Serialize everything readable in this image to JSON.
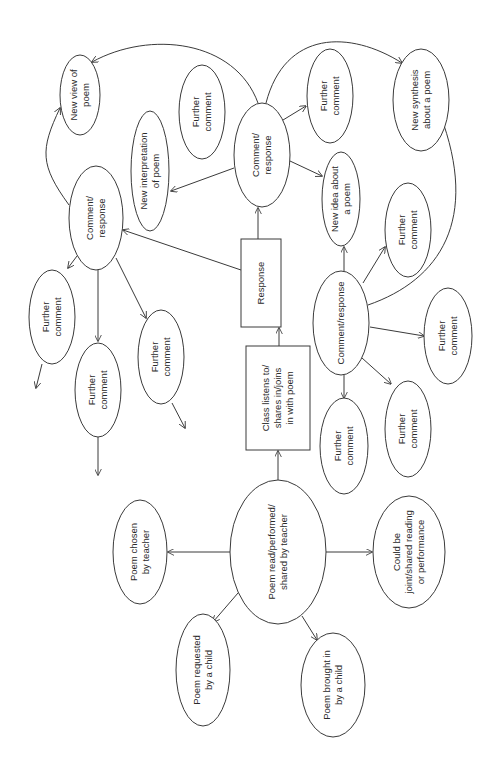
{
  "diagram": {
    "type": "concept-map",
    "orientation": "rotated 90deg counter-clockwise",
    "stroke_color": "#3a3a3a",
    "background": "#ffffff",
    "nodes": {
      "poem_read": {
        "lines": [
          "Poem read/performed/",
          "shared by teacher"
        ],
        "shape": "ellipse"
      },
      "poem_chosen": {
        "lines": [
          "Poem chosen",
          "by teacher"
        ],
        "shape": "ellipse"
      },
      "poem_requested": {
        "lines": [
          "Poem requested",
          "by a child"
        ],
        "shape": "ellipse"
      },
      "poem_brought": {
        "lines": [
          "Poem brought in",
          "by a child"
        ],
        "shape": "ellipse"
      },
      "could_be_joint": {
        "lines": [
          "Could be",
          "joint/shared reading",
          "or performance"
        ],
        "shape": "ellipse"
      },
      "class_listens": {
        "lines": [
          "Class listens to/",
          "shares in/joins",
          "in with poem"
        ],
        "shape": "rectangle"
      },
      "response": {
        "lines": [
          "Response"
        ],
        "shape": "rectangle"
      },
      "comment_top": {
        "lines": [
          "Comment/",
          "response"
        ],
        "shape": "ellipse"
      },
      "comment_left": {
        "lines": [
          "Comment/",
          "response"
        ],
        "shape": "ellipse"
      },
      "comment_right": {
        "lines": [
          "Comment/response"
        ],
        "shape": "ellipse"
      },
      "new_view": {
        "lines": [
          "New view of",
          "poem"
        ],
        "shape": "ellipse"
      },
      "new_interpretation": {
        "lines": [
          "New interpretation",
          "of poem"
        ],
        "shape": "ellipse"
      },
      "new_idea": {
        "lines": [
          "New idea about",
          "a poem"
        ],
        "shape": "ellipse"
      },
      "new_synthesis": {
        "lines": [
          "New synthesis",
          "about a poem"
        ],
        "shape": "ellipse"
      },
      "further_top": {
        "lines": [
          "Further",
          "comment"
        ],
        "shape": "ellipse"
      },
      "further_left_1": {
        "lines": [
          "Further",
          "comment"
        ],
        "shape": "ellipse"
      },
      "further_left_2": {
        "lines": [
          "Further",
          "comment"
        ],
        "shape": "ellipse"
      },
      "further_left_3": {
        "lines": [
          "Further",
          "comment"
        ],
        "shape": "ellipse"
      },
      "further_right_1": {
        "lines": [
          "Further",
          "comment"
        ],
        "shape": "ellipse"
      },
      "further_right_2": {
        "lines": [
          "Further",
          "comment"
        ],
        "shape": "ellipse"
      },
      "further_right_3": {
        "lines": [
          "Further",
          "comment"
        ],
        "shape": "ellipse"
      },
      "further_right_4": {
        "lines": [
          "Further",
          "comment"
        ],
        "shape": "ellipse"
      }
    },
    "edges": [
      {
        "from": "poem_read",
        "to": "poem_chosen"
      },
      {
        "from": "poem_read",
        "to": "poem_requested"
      },
      {
        "from": "poem_read",
        "to": "poem_brought"
      },
      {
        "from": "poem_read",
        "to": "could_be_joint"
      },
      {
        "from": "poem_read",
        "to": "class_listens"
      },
      {
        "from": "class_listens",
        "to": "response"
      },
      {
        "from": "response",
        "to": "comment_top"
      },
      {
        "from": "response",
        "to": "comment_left"
      },
      {
        "from": "comment_top",
        "to": "new_interpretation"
      },
      {
        "from": "comment_top",
        "to": "further_top"
      },
      {
        "from": "comment_top",
        "to": "new_idea"
      },
      {
        "from": "comment_top",
        "to": "new_view"
      },
      {
        "from": "comment_top",
        "to": "new_synthesis"
      },
      {
        "from": "comment_left",
        "to": "new_view"
      },
      {
        "from": "comment_left",
        "to": "further_left_1"
      },
      {
        "from": "comment_left",
        "to": "further_left_2"
      },
      {
        "from": "comment_left",
        "to": "further_left_3"
      },
      {
        "from": "comment_right",
        "to": "new_idea"
      },
      {
        "from": "comment_right",
        "to": "further_right_1"
      },
      {
        "from": "comment_right",
        "to": "further_right_2"
      },
      {
        "from": "comment_right",
        "to": "further_right_3"
      },
      {
        "from": "comment_right",
        "to": "further_right_4"
      },
      {
        "from": "comment_right",
        "to": "new_synthesis"
      }
    ]
  }
}
